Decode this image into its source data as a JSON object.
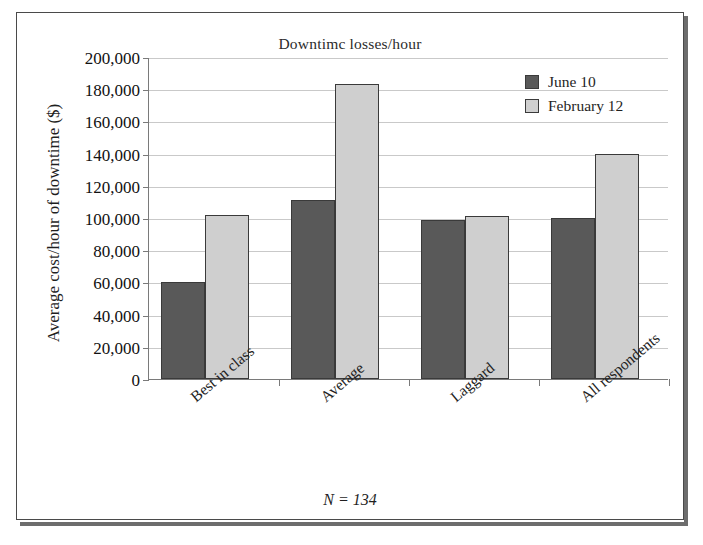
{
  "chart_data": {
    "type": "bar",
    "title": "Downtimc losses/hour",
    "xlabel": "",
    "ylabel": "Average cost/hour of downtime ($)",
    "categories": [
      "Best in class",
      "Average",
      "Laggard",
      "All respondents"
    ],
    "series": [
      {
        "name": "June 10",
        "color": "#595959",
        "values": [
          60000,
          111000,
          99000,
          100000
        ]
      },
      {
        "name": "February 12",
        "color": "#cfcfcf",
        "values": [
          102000,
          183000,
          101000,
          140000
        ]
      }
    ],
    "ylim": [
      0,
      200000
    ],
    "ytick_step": 20000,
    "ytick_labels": [
      "0",
      "20,000",
      "40,000",
      "60,000",
      "80,000",
      "100,000",
      "120,000",
      "140,000",
      "160,000",
      "180,000",
      "200,000"
    ],
    "grid": true,
    "legend_position": "top-right",
    "annotation": "N = 134",
    "xlabel_rotation": -40
  },
  "footnote": {
    "text": "N = 134"
  }
}
